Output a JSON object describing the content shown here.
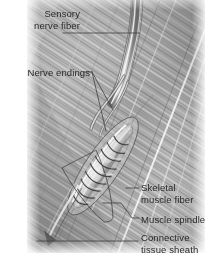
{
  "figure": {
    "type": "anatomical-illustration",
    "medium": "grayscale pencil drawing",
    "background_color": "#ffffff",
    "label_text_color": "#28282b",
    "leader_line_color": "#4a4a4c",
    "image_box": {
      "x": 27,
      "y": 0,
      "width": 178,
      "height": 253
    }
  },
  "labels": {
    "sensory_nerve_fiber": "Sensory\nnerve fiber",
    "sensory_nerve_fiber_line1": "Sensory",
    "sensory_nerve_fiber_line2": "nerve fiber",
    "nerve_endings": "Nerve endings",
    "skeletal_muscle_fiber_line1": "Skeletal",
    "skeletal_muscle_fiber_line2": "muscle fiber",
    "muscle_spindle": "Muscle spindle",
    "connective_tissue_sheath_line1": "Connective",
    "connective_tissue_sheath_line2": "tissue sheath"
  },
  "structures": [
    {
      "name": "sensory-nerve-fiber",
      "description": "bundle of pale nerve fibers entering from top of frame"
    },
    {
      "name": "nerve-endings",
      "description": "annulospiral nerve endings coiled around intrafusal fibers"
    },
    {
      "name": "skeletal-muscle-fiber",
      "description": "extrafusal striated muscle fibers running diagonally"
    },
    {
      "name": "muscle-spindle",
      "description": "lens-shaped encapsulated spindle containing intrafusal fibers"
    },
    {
      "name": "connective-tissue-sheath",
      "description": "capsule of connective tissue enclosing the spindle"
    }
  ]
}
